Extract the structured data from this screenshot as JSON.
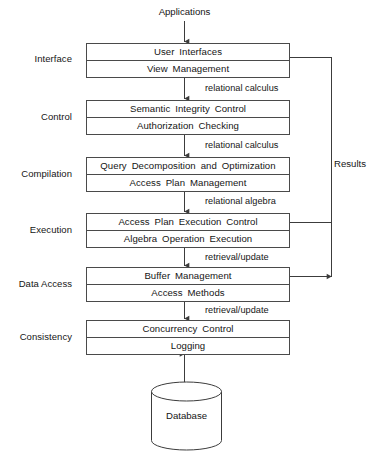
{
  "figure": {
    "background_color": "#ffffff",
    "line_color": "#4a4a4a",
    "text_color": "#151515"
  },
  "top_flow": {
    "source_label": "Applications"
  },
  "side_flow": {
    "return_label": "Results"
  },
  "stages": [
    {
      "id": "interface",
      "stage_label": "Interface",
      "rows": [
        "User  Interfaces",
        "View  Management"
      ],
      "outgoing_label": "relational calculus"
    },
    {
      "id": "control",
      "stage_label": "Control",
      "rows": [
        "Semantic  Integrity  Control",
        "Authorization  Checking"
      ],
      "outgoing_label": "relational calculus"
    },
    {
      "id": "compilation",
      "stage_label": "Compilation",
      "rows": [
        "Query  Decomposition  and  Optimization",
        "Access  Plan  Management"
      ],
      "outgoing_label": "relational algebra"
    },
    {
      "id": "execution",
      "stage_label": "Execution",
      "rows": [
        "Access  Plan  Execution  Control",
        "Algebra  Operation  Execution"
      ],
      "outgoing_label": "retrieval/update"
    },
    {
      "id": "data-access",
      "stage_label": "Data Access",
      "rows": [
        "Buffer  Management",
        "Access  Methods"
      ],
      "outgoing_label": "retrieval/update"
    },
    {
      "id": "consistency",
      "stage_label": "Consistency",
      "rows": [
        "Concurrency  Control",
        "Logging"
      ],
      "outgoing_label": ""
    }
  ],
  "datastore": {
    "label": "Database"
  }
}
